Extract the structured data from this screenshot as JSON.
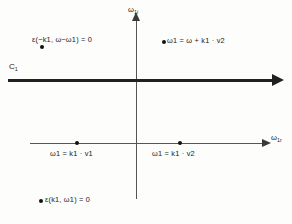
{
  "figure": {
    "type": "complex-plane-diagram",
    "background_color": "#fdfdfc",
    "ink_color": "#1a1a1a",
    "axes": {
      "vertical_label": "ω1i",
      "horizontal_label": "ω1r",
      "vertical_label_parts": {
        "base": "ω",
        "sub": "1i"
      },
      "horizontal_label_parts": {
        "base": "ω",
        "sub": "1r"
      }
    },
    "contour": {
      "name": "C1",
      "name_parts": {
        "base": "C",
        "sub": "1"
      },
      "direction": "rightward"
    },
    "points": [
      {
        "id": "eps-minus",
        "label": "ε(−k1, ω−ω1) = 0",
        "quadrant": "upper-left",
        "label_position": "above-right-of-dot"
      },
      {
        "id": "omega-v2-top",
        "label": "ω1 = ω + k1 · v2",
        "quadrant": "upper-right",
        "label_position": "right-of-dot"
      },
      {
        "id": "k1v1",
        "label": "ω1 = k1 · v1",
        "quadrant": "real-axis-left",
        "label_position": "below-dot"
      },
      {
        "id": "k1v2",
        "label": "ω1 = k1 · v2",
        "quadrant": "real-axis-right",
        "label_position": "below-dot"
      },
      {
        "id": "eps-plus",
        "label": "ε(k1, ω1) = 0",
        "quadrant": "lower-left",
        "label_position": "right-of-dot"
      }
    ],
    "caption_fragment": ""
  }
}
